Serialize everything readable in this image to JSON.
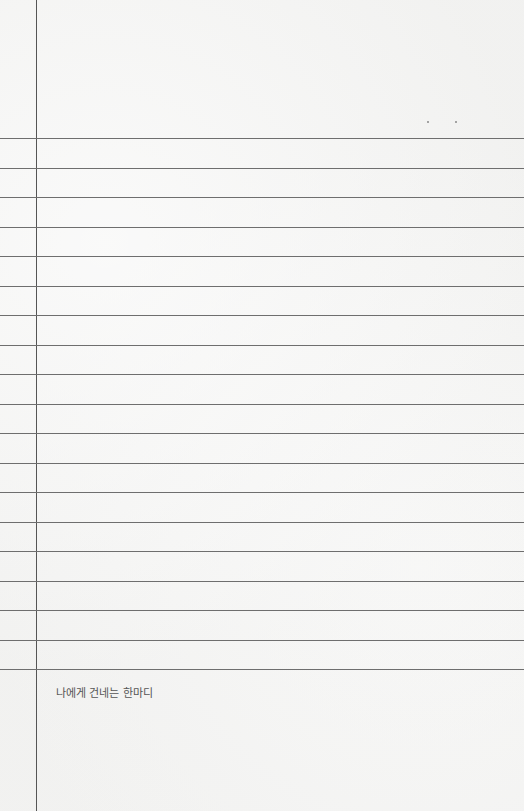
{
  "caption": "나에게 건네는 한마디",
  "rules": {
    "count": 19,
    "first_y": 138,
    "spacing": 29.5,
    "color": "#6e6e6e"
  },
  "margin_line": {
    "x": 36,
    "color": "#555555"
  },
  "dots": [
    {
      "x": 427,
      "y": 121
    },
    {
      "x": 455,
      "y": 121
    }
  ]
}
